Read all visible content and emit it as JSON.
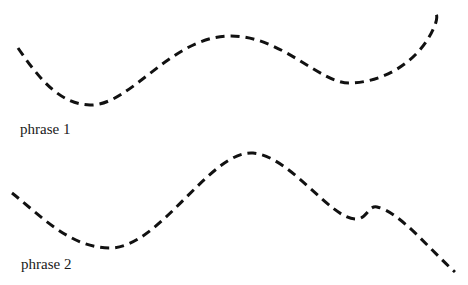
{
  "diagram": {
    "type": "pitch-contours",
    "line_style": "dashed",
    "line_color": "#111111",
    "phrases": [
      {
        "label": "phrase 1",
        "path": "M18,48 C40,80 60,104 90,105 C130,106 170,38 228,36 C280,34 320,84 350,83 C390,82 425,55 436,22 C437,18 437,15 436,14"
      },
      {
        "label": "phrase 2",
        "path": "M12,193 C40,215 70,248 110,248 C160,248 210,150 253,153 C290,156 330,218 355,219 C367,220 368,205 377,207 C400,212 430,250 455,272"
      }
    ]
  }
}
